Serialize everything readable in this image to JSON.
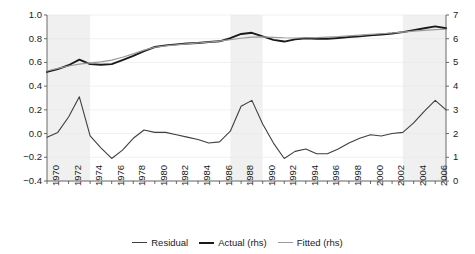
{
  "chart_data": {
    "type": "line",
    "title": "",
    "subtitle": "",
    "xlabel": "",
    "ylabel": "",
    "y2label": "",
    "grid": false,
    "legend_position": "bottom",
    "x": [
      1970,
      1971,
      1972,
      1973,
      1974,
      1975,
      1976,
      1977,
      1978,
      1979,
      1980,
      1981,
      1982,
      1983,
      1984,
      1985,
      1986,
      1987,
      1988,
      1989,
      1990,
      1991,
      1992,
      1993,
      1994,
      1995,
      1996,
      1997,
      1998,
      1999,
      2000,
      2001,
      2002,
      2003,
      2004,
      2005,
      2006,
      2007
    ],
    "xlim": [
      1970,
      2007
    ],
    "xticks": [
      1970,
      1972,
      1974,
      1976,
      1978,
      1980,
      1982,
      1984,
      1986,
      1988,
      1990,
      1992,
      1994,
      1996,
      1998,
      2000,
      2002,
      2004,
      2006
    ],
    "xticklabels": [
      "1970",
      "1972",
      "1974",
      "1976",
      "1978",
      "1980",
      "1982",
      "1984",
      "1986",
      "1988",
      "1990",
      "1992",
      "1994",
      "1996",
      "1998",
      "2000",
      "2002",
      "2004",
      "2006"
    ],
    "ylim": [
      -0.4,
      1.0
    ],
    "yticks": [
      -0.4,
      -0.2,
      0.0,
      0.2,
      0.4,
      0.6,
      0.8,
      1.0
    ],
    "yticklabels": [
      "−0.4",
      "−0.2",
      "0.0",
      "0.2",
      "0.4",
      "0.6",
      "0.8",
      "1.0"
    ],
    "y2lim": [
      0,
      7
    ],
    "y2ticks": [
      0,
      1,
      2,
      3,
      4,
      5,
      6,
      7
    ],
    "y2ticklabels": [
      "0",
      "1",
      "2",
      "3",
      "4",
      "5",
      "6",
      "7"
    ],
    "series": [
      {
        "name": "Residual",
        "axis": "left",
        "color": "#3f3f3f",
        "width": 1.1,
        "values": [
          -0.03,
          0.01,
          0.14,
          0.31,
          -0.02,
          -0.12,
          -0.21,
          -0.14,
          -0.04,
          0.03,
          0.01,
          0.01,
          -0.01,
          -0.03,
          -0.05,
          -0.08,
          -0.07,
          0.02,
          0.23,
          0.28,
          0.08,
          -0.08,
          -0.21,
          -0.15,
          -0.13,
          -0.17,
          -0.17,
          -0.13,
          -0.08,
          -0.04,
          -0.01,
          -0.02,
          0.0,
          0.01,
          0.09,
          0.19,
          0.28,
          0.2
        ]
      },
      {
        "name": "Actual (rhs)",
        "axis": "right",
        "color": "#1a1a1a",
        "width": 1.9,
        "values": [
          4.6,
          4.72,
          4.88,
          5.12,
          4.93,
          4.9,
          4.93,
          5.1,
          5.28,
          5.48,
          5.65,
          5.72,
          5.76,
          5.8,
          5.82,
          5.86,
          5.89,
          6.02,
          6.2,
          6.25,
          6.1,
          5.95,
          5.88,
          5.97,
          6.02,
          6.0,
          6.0,
          6.03,
          6.07,
          6.1,
          6.14,
          6.18,
          6.22,
          6.28,
          6.36,
          6.44,
          6.52,
          6.44
        ]
      },
      {
        "name": "Fitted (rhs)",
        "axis": "right",
        "color": "#9a9a9a",
        "width": 1.2,
        "values": [
          4.64,
          4.75,
          4.85,
          4.93,
          4.98,
          5.02,
          5.1,
          5.22,
          5.36,
          5.52,
          5.64,
          5.7,
          5.74,
          5.78,
          5.82,
          5.86,
          5.9,
          5.96,
          6.02,
          6.07,
          6.08,
          6.06,
          6.04,
          6.03,
          6.04,
          6.05,
          6.07,
          6.09,
          6.12,
          6.15,
          6.18,
          6.21,
          6.24,
          6.28,
          6.32,
          6.35,
          6.38,
          6.4
        ]
      }
    ],
    "shaded_bands": [
      {
        "name": "recession-band-1",
        "start": 1970,
        "end": 1974,
        "color": "#f0f0f0"
      },
      {
        "name": "recession-band-2",
        "start": 1987,
        "end": 1990,
        "color": "#f0f0f0"
      },
      {
        "name": "recession-band-3",
        "start": 2003,
        "end": 2007,
        "color": "#f0f0f0"
      }
    ],
    "legend": [
      "Residual",
      "Actual (rhs)",
      "Fitted (rhs)"
    ]
  }
}
